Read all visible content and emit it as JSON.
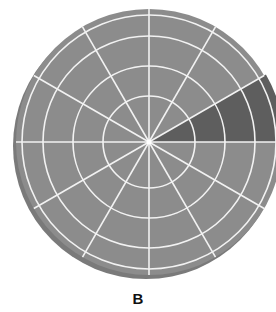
{
  "figure": {
    "label": "B",
    "center": [
      149,
      142
    ],
    "outer_radius": 133,
    "ring_radii": [
      46,
      76,
      106,
      133
    ],
    "spoke_count": 12,
    "spoke_start_deg": 0,
    "colors": {
      "disc": "#8c8c8c",
      "shadow": "#7a7a7a",
      "grid": "#f2f2f2",
      "highlight": "#5e5e5e",
      "background": "#ffffff"
    },
    "highlighted_sector": {
      "from_deg": 0,
      "to_deg": 30,
      "description": "darkened wedge between 3 o'clock and 2 o'clock spokes, full radius"
    }
  }
}
